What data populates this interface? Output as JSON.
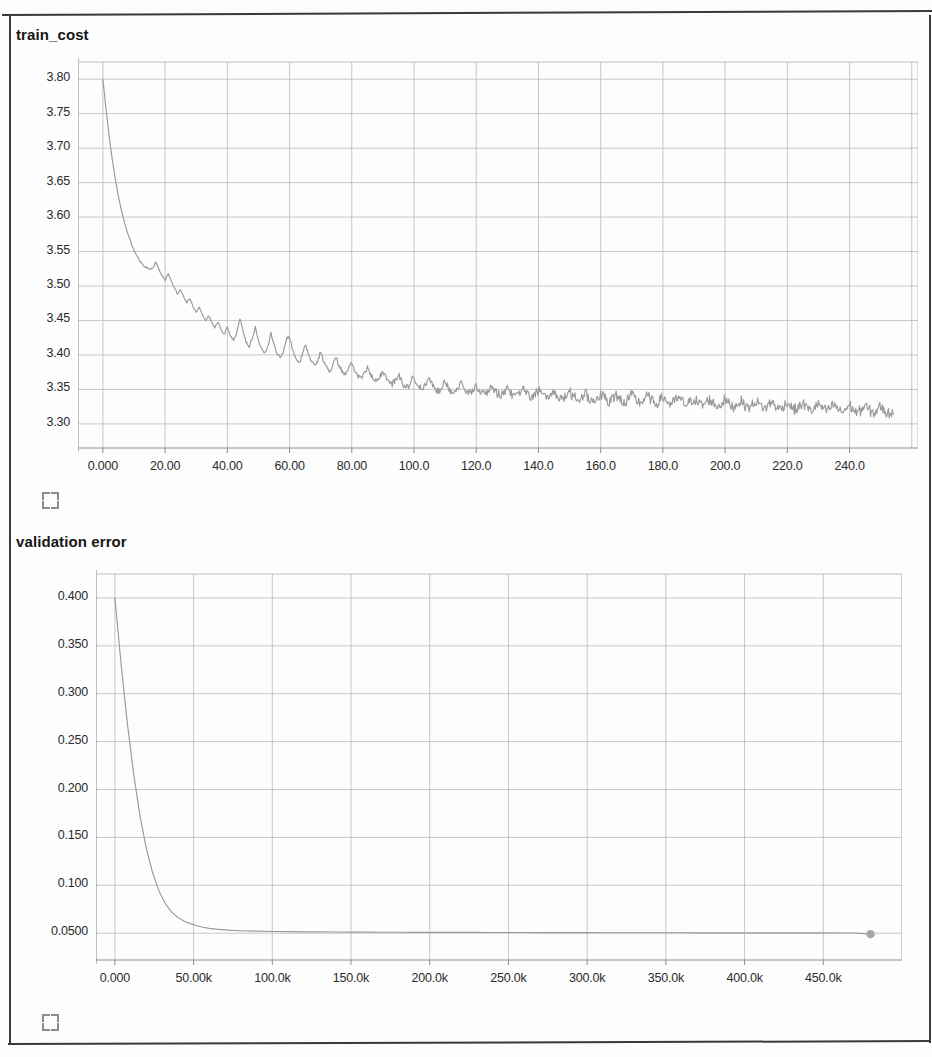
{
  "page": {
    "background_color": "#fdfdfd",
    "frame_color": "#3a3a3a",
    "line_color": "#9a9a9a",
    "grid_color": "#b9b9b9",
    "axis_color": "#8f8f8f",
    "text_color": "#1a1a1a"
  },
  "panels": [
    {
      "title": "train_cost",
      "expand_icon": "expand-icon"
    },
    {
      "title": "validation error",
      "expand_icon": "expand-icon"
    }
  ],
  "chart_data": [
    {
      "type": "line",
      "title": "train_cost",
      "xlabel": "",
      "ylabel": "",
      "grid": true,
      "legend": "none",
      "xlim": [
        -8,
        262
      ],
      "ylim": [
        3.265,
        3.825
      ],
      "xticks": [
        "0.000",
        "20.00",
        "40.00",
        "60.00",
        "80.00",
        "100.0",
        "120.0",
        "140.0",
        "160.0",
        "180.0",
        "200.0",
        "220.0",
        "240.0"
      ],
      "xtick_values": [
        0,
        20,
        40,
        60,
        80,
        100,
        120,
        140,
        160,
        180,
        200,
        220,
        240
      ],
      "yticks": [
        "3.30",
        "3.35",
        "3.40",
        "3.45",
        "3.50",
        "3.55",
        "3.60",
        "3.65",
        "3.70",
        "3.75",
        "3.80"
      ],
      "ytick_values": [
        3.3,
        3.35,
        3.4,
        3.45,
        3.5,
        3.55,
        3.6,
        3.65,
        3.7,
        3.75,
        3.8
      ],
      "series": [
        {
          "name": "train_cost",
          "x": [
            0,
            1,
            2,
            3,
            4,
            5,
            6,
            7,
            8,
            9,
            10,
            11,
            12,
            13,
            14,
            15,
            16,
            17,
            18,
            19,
            20,
            21,
            22,
            23,
            24,
            25,
            26,
            27,
            28,
            29,
            30,
            31,
            32,
            33,
            34,
            35,
            36,
            37,
            38,
            39,
            40,
            41,
            42,
            43,
            44,
            45,
            46,
            47,
            48,
            49,
            50,
            51,
            52,
            53,
            54,
            55,
            56,
            57,
            58,
            59,
            60,
            61,
            62,
            63,
            64,
            65,
            66,
            67,
            68,
            69,
            70,
            71,
            72,
            73,
            74,
            75,
            76,
            77,
            78,
            79,
            80,
            81,
            82,
            83,
            84,
            85,
            86,
            87,
            88,
            89,
            90,
            91,
            92,
            93,
            94,
            95,
            96,
            97,
            98,
            99,
            100,
            101,
            102,
            103,
            104,
            105,
            106,
            107,
            108,
            109,
            110,
            111,
            112,
            113,
            114,
            115,
            116,
            117,
            118,
            119,
            120,
            121,
            122,
            123,
            124,
            125,
            126,
            127,
            128,
            129,
            130,
            131,
            132,
            133,
            134,
            135,
            136,
            137,
            138,
            139,
            140,
            141,
            142,
            143,
            144,
            145,
            146,
            147,
            148,
            149,
            150,
            151,
            152,
            153,
            154,
            155,
            156,
            157,
            158,
            159,
            160,
            161,
            162,
            163,
            164,
            165,
            166,
            167,
            168,
            169,
            170,
            171,
            172,
            173,
            174,
            175,
            176,
            177,
            178,
            179,
            180,
            181,
            182,
            183,
            184,
            185,
            186,
            187,
            188,
            189,
            190,
            191,
            192,
            193,
            194,
            195,
            196,
            197,
            198,
            199,
            200,
            201,
            202,
            203,
            204,
            205,
            206,
            207,
            208,
            209,
            210,
            211,
            212,
            213,
            214,
            215,
            216,
            217,
            218,
            219,
            220,
            221,
            222,
            223,
            224,
            225,
            226,
            227,
            228,
            229,
            230,
            231,
            232,
            233,
            234,
            235,
            236,
            237,
            238,
            239,
            240,
            241,
            242,
            243,
            244,
            245,
            246,
            247,
            248,
            249,
            250,
            251,
            252,
            253,
            254
          ],
          "y": [
            3.8,
            3.757,
            3.718,
            3.684,
            3.655,
            3.63,
            3.609,
            3.591,
            3.576,
            3.563,
            3.552,
            3.543,
            3.536,
            3.53,
            3.527,
            3.524,
            3.527,
            3.534,
            3.524,
            3.515,
            3.508,
            3.518,
            3.507,
            3.497,
            3.489,
            3.495,
            3.484,
            3.476,
            3.482,
            3.47,
            3.462,
            3.47,
            3.458,
            3.45,
            3.457,
            3.446,
            3.44,
            3.448,
            3.437,
            3.43,
            3.441,
            3.428,
            3.421,
            3.432,
            3.453,
            3.437,
            3.419,
            3.412,
            3.424,
            3.44,
            3.421,
            3.41,
            3.404,
            3.412,
            3.432,
            3.415,
            3.402,
            3.396,
            3.405,
            3.423,
            3.427,
            3.408,
            3.394,
            3.388,
            3.398,
            3.415,
            3.403,
            3.39,
            3.384,
            3.392,
            3.404,
            3.391,
            3.382,
            3.377,
            3.386,
            3.396,
            3.384,
            3.375,
            3.371,
            3.379,
            3.389,
            3.377,
            3.369,
            3.366,
            3.374,
            3.382,
            3.371,
            3.364,
            3.361,
            3.368,
            3.377,
            3.367,
            3.36,
            3.357,
            3.364,
            3.372,
            3.362,
            3.356,
            3.354,
            3.361,
            3.368,
            3.359,
            3.353,
            3.351,
            3.358,
            3.365,
            3.356,
            3.35,
            3.348,
            3.355,
            3.362,
            3.353,
            3.348,
            3.346,
            3.352,
            3.359,
            3.351,
            3.346,
            3.344,
            3.35,
            3.357,
            3.349,
            3.344,
            3.342,
            3.348,
            3.355,
            3.347,
            3.343,
            3.341,
            3.347,
            3.353,
            3.345,
            3.341,
            3.34,
            3.345,
            3.351,
            3.344,
            3.34,
            3.338,
            3.344,
            3.35,
            3.343,
            3.339,
            3.337,
            3.343,
            3.348,
            3.341,
            3.338,
            3.336,
            3.341,
            3.347,
            3.34,
            3.337,
            3.335,
            3.34,
            3.345,
            3.339,
            3.335,
            3.334,
            3.339,
            3.344,
            3.338,
            3.334,
            3.333,
            3.338,
            3.343,
            3.337,
            3.333,
            3.332,
            3.337,
            3.342,
            3.336,
            3.332,
            3.331,
            3.336,
            3.341,
            3.335,
            3.331,
            3.33,
            3.335,
            3.339,
            3.334,
            3.33,
            3.329,
            3.334,
            3.338,
            3.333,
            3.329,
            3.328,
            3.333,
            3.337,
            3.332,
            3.328,
            3.327,
            3.332,
            3.336,
            3.331,
            3.327,
            3.326,
            3.331,
            3.335,
            3.33,
            3.326,
            3.325,
            3.33,
            3.334,
            3.329,
            3.325,
            3.324,
            3.329,
            3.333,
            3.328,
            3.324,
            3.323,
            3.328,
            3.332,
            3.327,
            3.323,
            3.322,
            3.327,
            3.331,
            3.326,
            3.322,
            3.321,
            3.326,
            3.33,
            3.325,
            3.321,
            3.32,
            3.325,
            3.329,
            3.324,
            3.32,
            3.319,
            3.324,
            3.328,
            3.323,
            3.319,
            3.318,
            3.323,
            3.327,
            3.322,
            3.318,
            3.317,
            3.322,
            3.326,
            3.321,
            3.317,
            3.316,
            3.321,
            3.325,
            3.32,
            3.316,
            3.315,
            3.32,
            3.324,
            3.319,
            3.315,
            3.314
          ]
        }
      ],
      "noise_amplitude": 0.016,
      "final_value": 3.305,
      "start_value": 3.8
    },
    {
      "type": "line",
      "title": "validation error",
      "xlabel": "",
      "ylabel": "",
      "grid": true,
      "legend": "none",
      "xlim": [
        -12000,
        500000
      ],
      "ylim": [
        0.022,
        0.425
      ],
      "xticks": [
        "0.000",
        "50.00k",
        "100.0k",
        "150.0k",
        "200.0k",
        "250.0k",
        "300.0k",
        "350.0k",
        "400.0k",
        "450.0k"
      ],
      "xtick_values": [
        0,
        50000,
        100000,
        150000,
        200000,
        250000,
        300000,
        350000,
        400000,
        450000
      ],
      "yticks": [
        "0.0500",
        "0.100",
        "0.150",
        "0.200",
        "0.250",
        "0.300",
        "0.350",
        "0.400"
      ],
      "ytick_values": [
        0.05,
        0.1,
        0.15,
        0.2,
        0.25,
        0.3,
        0.35,
        0.4
      ],
      "series": [
        {
          "name": "validation error",
          "marker_end": true,
          "x": [
            0,
            4000,
            8000,
            12000,
            16000,
            20000,
            24000,
            28000,
            32000,
            36000,
            40000,
            44000,
            48000,
            52000,
            56000,
            60000,
            64000,
            68000,
            72000,
            76000,
            80000,
            90000,
            100000,
            110000,
            120000,
            130000,
            140000,
            150000,
            160000,
            170000,
            180000,
            190000,
            200000,
            210000,
            220000,
            230000,
            240000,
            250000,
            260000,
            270000,
            280000,
            290000,
            300000,
            310000,
            320000,
            330000,
            340000,
            350000,
            360000,
            370000,
            380000,
            390000,
            400000,
            410000,
            420000,
            430000,
            440000,
            450000,
            460000,
            470000,
            480000
          ],
          "y": [
            0.4,
            0.33,
            0.268,
            0.215,
            0.172,
            0.138,
            0.113,
            0.094,
            0.081,
            0.072,
            0.0665,
            0.0625,
            0.06,
            0.0578,
            0.0562,
            0.055,
            0.0542,
            0.0537,
            0.0532,
            0.0528,
            0.0525,
            0.0521,
            0.0518,
            0.0516,
            0.0514,
            0.0513,
            0.0512,
            0.0511,
            0.0511,
            0.051,
            0.051,
            0.0509,
            0.0509,
            0.0508,
            0.0508,
            0.0508,
            0.0507,
            0.0507,
            0.0507,
            0.0506,
            0.0506,
            0.0506,
            0.0506,
            0.0505,
            0.0505,
            0.0505,
            0.0505,
            0.0505,
            0.0504,
            0.0504,
            0.0504,
            0.0504,
            0.0504,
            0.0503,
            0.0503,
            0.0503,
            0.0503,
            0.0503,
            0.0502,
            0.0502,
            0.049
          ]
        }
      ],
      "final_value": 0.049,
      "start_value": 0.4
    }
  ]
}
